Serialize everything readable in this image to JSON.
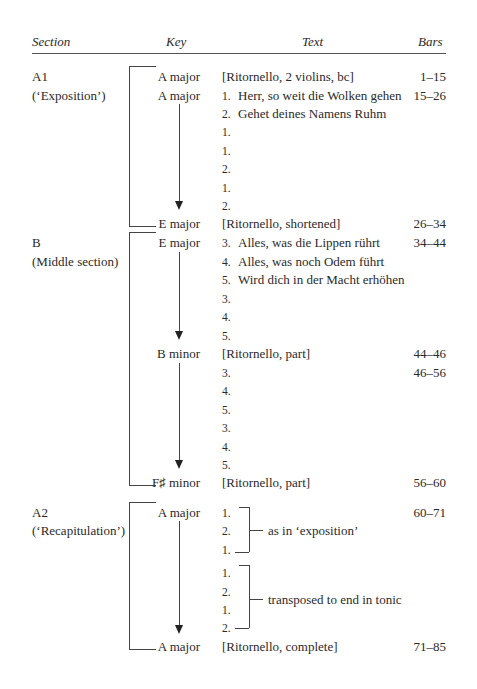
{
  "headers": {
    "section": "Section",
    "key": "Key",
    "text": "Text",
    "bars": "Bars"
  },
  "sections": [
    {
      "label": "A1",
      "subtitle": "(‘Exposition’)",
      "rows": [
        {
          "key": "A major",
          "text": "[Ritornello, 2 violins, bc]",
          "bars": "1–15"
        },
        {
          "key": "A major",
          "num": "1.",
          "text": "Herr, so weit die Wolken gehen",
          "bars": "15–26"
        },
        {
          "num": "2.",
          "text": "Gehet deines Namens Ruhm"
        },
        {
          "num": "1."
        },
        {
          "num": "1."
        },
        {
          "num": "2."
        },
        {
          "num": "1."
        },
        {
          "num": "2."
        },
        {
          "key": "E major",
          "text": "[Ritornello, shortened]",
          "bars": "26–34"
        }
      ]
    },
    {
      "label": "B",
      "subtitle": "(Middle section)",
      "rows": [
        {
          "key": "E major",
          "num": "3.",
          "text": "Alles, was die Lippen rührt",
          "bars": "34–44"
        },
        {
          "num": "4.",
          "text": "Alles, was noch Odem führt"
        },
        {
          "num": "5.",
          "text": "Wird dich in der Macht erhöhen"
        },
        {
          "num": "3."
        },
        {
          "num": "4."
        },
        {
          "num": "5."
        },
        {
          "key": "B minor",
          "text": "[Ritornello, part]",
          "bars": "44–46"
        },
        {
          "num": "3.",
          "bars": "46–56"
        },
        {
          "num": "4."
        },
        {
          "num": "5."
        },
        {
          "num": "3."
        },
        {
          "num": "4."
        },
        {
          "num": "5."
        },
        {
          "key": "F♯ minor",
          "text": "[Ritornello, part]",
          "bars": "56–60"
        }
      ]
    },
    {
      "label": "A2",
      "subtitle": "(‘Recapitulation’)",
      "rows": [
        {
          "key": "A major",
          "num": "1.",
          "bars": "60–71"
        },
        {
          "num": "2."
        },
        {
          "num": "1."
        },
        {
          "num": "1."
        },
        {
          "num": "2."
        },
        {
          "num": "1."
        },
        {
          "num": "2."
        },
        {
          "key": "A major",
          "text": "[Ritornello, complete]",
          "bars": "71–85"
        }
      ],
      "brackets": [
        {
          "label": "as in ‘exposition’"
        },
        {
          "label": "transposed to end in tonic"
        }
      ]
    }
  ]
}
